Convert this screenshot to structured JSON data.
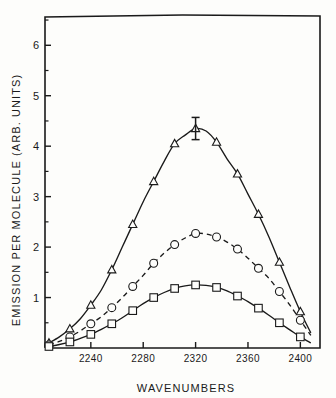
{
  "chart_data": {
    "type": "line",
    "title": "",
    "xlabel": "WAVENUMBERS",
    "ylabel": "EMISSION PER MOLECULE (ARB. UNITS)",
    "xlim": [
      2205,
      2415
    ],
    "ylim": [
      0,
      6.6
    ],
    "xticks": [
      2240,
      2280,
      2320,
      2360,
      2400
    ],
    "xtick_labels": [
      "2240",
      "2280",
      "2320",
      "2360",
      "2400"
    ],
    "yticks": [
      1,
      2,
      3,
      4,
      5,
      6
    ],
    "ytick_labels": [
      "1",
      "2",
      "3",
      "4",
      "5",
      "6"
    ],
    "grid": false,
    "legend": "none",
    "annotations": [
      {
        "name": "error-bar",
        "x": 2320,
        "y": 4.35,
        "yerr": 0.22
      }
    ],
    "series": [
      {
        "name": "triangle-series",
        "marker": "triangle",
        "linestyle": "solid",
        "color": "#1a1a1a",
        "x": [
          2208,
          2216,
          2224,
          2232,
          2240,
          2248,
          2256,
          2264,
          2272,
          2280,
          2288,
          2296,
          2304,
          2312,
          2320,
          2328,
          2336,
          2344,
          2352,
          2360,
          2368,
          2376,
          2384,
          2392,
          2400,
          2408
        ],
        "y": [
          0.1,
          0.22,
          0.38,
          0.58,
          0.85,
          1.15,
          1.55,
          2.0,
          2.45,
          2.9,
          3.3,
          3.7,
          4.05,
          4.22,
          4.35,
          4.3,
          4.08,
          3.75,
          3.45,
          3.05,
          2.65,
          2.2,
          1.7,
          1.2,
          0.72,
          0.3
        ]
      },
      {
        "name": "circle-series",
        "marker": "circle",
        "linestyle": "dashed",
        "color": "#1a1a1a",
        "x": [
          2208,
          2216,
          2224,
          2232,
          2240,
          2248,
          2256,
          2264,
          2272,
          2280,
          2288,
          2296,
          2304,
          2312,
          2320,
          2328,
          2336,
          2344,
          2352,
          2360,
          2368,
          2376,
          2384,
          2392,
          2400,
          2408
        ],
        "y": [
          0.06,
          0.13,
          0.22,
          0.34,
          0.48,
          0.62,
          0.8,
          1.0,
          1.22,
          1.44,
          1.68,
          1.88,
          2.05,
          2.18,
          2.27,
          2.26,
          2.2,
          2.1,
          1.96,
          1.78,
          1.58,
          1.38,
          1.12,
          0.85,
          0.55,
          0.25
        ]
      },
      {
        "name": "square-series",
        "marker": "square",
        "linestyle": "solid",
        "color": "#1a1a1a",
        "x": [
          2208,
          2216,
          2224,
          2232,
          2240,
          2248,
          2256,
          2264,
          2272,
          2280,
          2288,
          2296,
          2304,
          2312,
          2320,
          2328,
          2336,
          2344,
          2352,
          2360,
          2368,
          2376,
          2384,
          2392,
          2400,
          2408
        ],
        "y": [
          0.03,
          0.07,
          0.12,
          0.19,
          0.27,
          0.37,
          0.48,
          0.6,
          0.74,
          0.88,
          1.0,
          1.1,
          1.18,
          1.23,
          1.25,
          1.24,
          1.2,
          1.13,
          1.03,
          0.92,
          0.79,
          0.65,
          0.5,
          0.36,
          0.22,
          0.1
        ]
      }
    ]
  }
}
